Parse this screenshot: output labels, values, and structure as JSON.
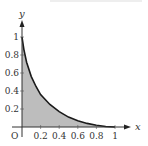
{
  "chart_data": {
    "type": "area",
    "title": "",
    "xlabel": "x",
    "ylabel": "y",
    "origin_label": "O",
    "x_ticks": [
      "0.2",
      "0.4",
      "0.6",
      "0.8",
      "1"
    ],
    "y_ticks": [
      "0.2",
      "0.4",
      "0.6",
      "0.8",
      "1"
    ],
    "xlim": [
      0,
      1.15
    ],
    "ylim": [
      0,
      1.15
    ],
    "grid": false,
    "series": [
      {
        "name": "curve",
        "x": [
          0,
          0.02,
          0.05,
          0.1,
          0.15,
          0.2,
          0.3,
          0.4,
          0.5,
          0.6,
          0.7,
          0.8,
          0.9,
          1.0
        ],
        "y": [
          1.0,
          0.86,
          0.72,
          0.56,
          0.45,
          0.36,
          0.25,
          0.17,
          0.11,
          0.07,
          0.04,
          0.02,
          0.005,
          0.0
        ]
      }
    ],
    "shaded_region": "area under curve from x=0 to x=1",
    "colors": {
      "fill": "#bdbdbd",
      "curve": "#1a1a1a",
      "axis": "#333333"
    }
  }
}
